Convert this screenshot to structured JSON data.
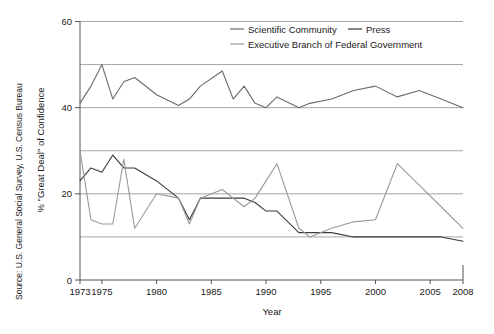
{
  "figure": {
    "source_note": "Source: U.S. General Social Survey, U.S. Census Bureau",
    "y_axis_title": "% \"Great Deal\" of Confidence",
    "x_axis_title": "Year"
  },
  "colors": {
    "scientific_community": "#6b6b6b",
    "press": "#3a3a3a",
    "executive_branch": "#9a9a9a",
    "gridline": "#9a9a9a",
    "axis": "#555555",
    "background": "#ffffff",
    "text": "#1a1a1a"
  },
  "legend": {
    "position": "top-right",
    "entries": [
      {
        "label": "Scientific Community",
        "color_key": "scientific_community"
      },
      {
        "label": "Press",
        "color_key": "press"
      },
      {
        "label": "Executive Branch of Federal Government",
        "color_key": "executive_branch"
      }
    ]
  },
  "chart_data": {
    "type": "line",
    "title": "",
    "subtitle": "",
    "xlabel": "Year",
    "ylabel": "% \"Great Deal\" of Confidence",
    "xlim": [
      1973,
      2008
    ],
    "ylim": [
      0,
      60
    ],
    "ytick_labels": [
      "0",
      "20",
      "40",
      "60"
    ],
    "yticks": [
      0,
      20,
      40,
      60
    ],
    "y_gridlines": [
      10,
      20,
      30,
      40,
      50,
      60
    ],
    "grid": true,
    "xticks": [
      1973,
      1975,
      1980,
      1985,
      1990,
      1995,
      2000,
      2005,
      2008
    ],
    "xtick_labels": [
      "1973",
      "1975",
      "1980",
      "1985",
      "1990",
      "1995",
      "2000",
      "2005",
      "2008"
    ],
    "legend_position": "upper right",
    "annotations": [
      "Source: U.S. General Social Survey, U.S. Census Bureau"
    ],
    "series": [
      {
        "name": "Scientific Community",
        "color": "#6b6b6b",
        "x": [
          1973,
          1974,
          1975,
          1976,
          1977,
          1978,
          1980,
          1982,
          1983,
          1984,
          1986,
          1987,
          1988,
          1989,
          1990,
          1991,
          1993,
          1994,
          1996,
          1998,
          2000,
          2002,
          2004,
          2006,
          2008
        ],
        "values": [
          41,
          45,
          50,
          42,
          46,
          47,
          43,
          40.5,
          42,
          45,
          48.5,
          42,
          45,
          41,
          40,
          42.5,
          40,
          41,
          42,
          44,
          45,
          42.5,
          44,
          42,
          40
        ]
      },
      {
        "name": "Press",
        "color": "#3a3a3a",
        "x": [
          1973,
          1974,
          1975,
          1976,
          1977,
          1978,
          1980,
          1982,
          1983,
          1984,
          1986,
          1987,
          1988,
          1989,
          1990,
          1991,
          1993,
          1994,
          1996,
          1998,
          2000,
          2002,
          2004,
          2006,
          2008
        ],
        "values": [
          23,
          26,
          25,
          29,
          26,
          26,
          23,
          19,
          14,
          19,
          19,
          19,
          19,
          18,
          16,
          16,
          11,
          11,
          11,
          10,
          10,
          10,
          10,
          10,
          9
        ]
      },
      {
        "name": "Executive Branch of Federal Government",
        "color": "#9a9a9a",
        "x": [
          1973,
          1974,
          1975,
          1976,
          1977,
          1978,
          1980,
          1982,
          1983,
          1984,
          1986,
          1987,
          1988,
          1989,
          1990,
          1991,
          1993,
          1994,
          1996,
          1998,
          2000,
          2002,
          2004,
          2006,
          2008
        ],
        "values": [
          30,
          14,
          13,
          13,
          28,
          12,
          20,
          19,
          13,
          19,
          21,
          19,
          17,
          19,
          23,
          27,
          12,
          10,
          12,
          13.5,
          14,
          27,
          22,
          17,
          12
        ]
      }
    ]
  }
}
